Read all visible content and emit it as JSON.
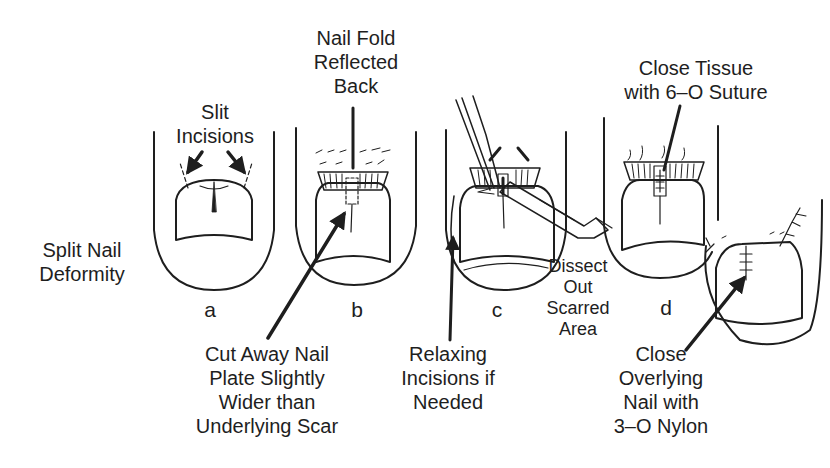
{
  "figure": {
    "panels": [
      {
        "id": "a",
        "letter": "a"
      },
      {
        "id": "b",
        "letter": "b"
      },
      {
        "id": "c",
        "letter": "c"
      },
      {
        "id": "d",
        "letter": "d"
      }
    ],
    "labels": {
      "split_nail": [
        "Split Nail",
        "Deformity"
      ],
      "slit_incisions": [
        "Slit",
        "Incisions"
      ],
      "nail_fold": [
        "Nail Fold",
        "Reflected",
        "Back"
      ],
      "cut_away": [
        "Cut Away Nail",
        "Plate Slightly",
        "Wider than",
        "Underlying Scar"
      ],
      "relaxing": [
        "Relaxing",
        "Incisions if",
        "Needed"
      ],
      "dissect": [
        "Dissect",
        "Out",
        "Scarred",
        "Area"
      ],
      "close_tissue": [
        "Close Tissue",
        "with 6–O Suture"
      ],
      "close_overlying": [
        "Close",
        "Overlying",
        "Nail with",
        "3–O Nylon"
      ]
    },
    "colors": {
      "ink": "#1e1e1e",
      "background": "#ffffff"
    }
  }
}
